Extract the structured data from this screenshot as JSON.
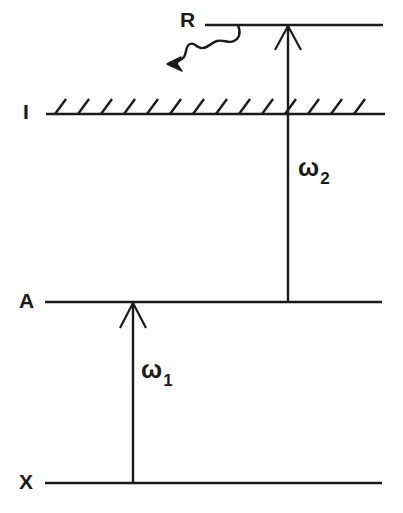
{
  "figure": {
    "type": "energy-level-diagram",
    "title": "",
    "background_color": "#ffffff",
    "line_color": "#1a1a1a",
    "width": 403,
    "height": 513
  },
  "levels": [
    {
      "id": "R",
      "label": "R",
      "label_x": 180,
      "label_y": 9,
      "line_y": 25,
      "line_x1": 205,
      "line_x2": 383,
      "hatched": false,
      "style": "solid"
    },
    {
      "id": "I",
      "label": "I",
      "label_x": 23,
      "label_y": 101,
      "line_y": 114,
      "line_x1": 46,
      "line_x2": 385,
      "hatched": true,
      "hatch_count": 14,
      "hatch_length": 17,
      "hatch_angle_deg": 55,
      "style": "solid-hatched"
    },
    {
      "id": "A",
      "label": "A",
      "label_x": 19,
      "label_y": 290,
      "line_y": 302,
      "line_x1": 45,
      "line_x2": 382,
      "hatched": false,
      "style": "solid"
    },
    {
      "id": "X",
      "label": "X",
      "label_x": 19,
      "label_y": 471,
      "line_y": 483,
      "line_x1": 45,
      "line_x2": 382,
      "hatched": false,
      "style": "solid"
    }
  ],
  "transitions": [
    {
      "id": "omega1",
      "label_text": "ω",
      "label_sub": "1",
      "from_level": "X",
      "to_level": "A",
      "x": 133,
      "y_start": 483,
      "y_end": 302,
      "direction": "up",
      "arrowhead": "open-v",
      "label_x": 141,
      "label_y": 357
    },
    {
      "id": "omega2",
      "label_text": "ω",
      "label_sub": "2",
      "from_level": "A",
      "to_level": "R",
      "x": 288,
      "y_start": 302,
      "y_end": 25,
      "direction": "up",
      "arrowhead": "open-v",
      "label_x": 298,
      "label_y": 155
    }
  ],
  "emission": {
    "id": "R-emission",
    "label": "R",
    "description": "wavy-arrow",
    "start_x": 238,
    "start_y": 25,
    "tip_x": 168,
    "tip_y": 64,
    "arrowhead": "solid-v"
  }
}
